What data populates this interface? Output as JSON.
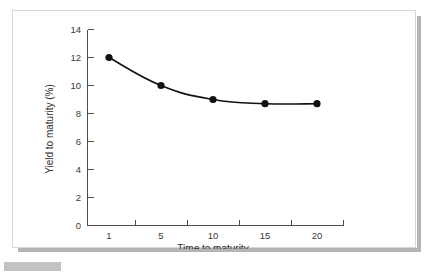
{
  "figure": {
    "background_color": "#ffffff",
    "border_color": "#d8d8d8",
    "shadow_color": "#b4b4b4",
    "tab_color": "#c3c3c3"
  },
  "chart_data": {
    "type": "line",
    "title": "",
    "subtitle": "",
    "xlabel": "Time to maturity",
    "ylabel": "Yield to maturity (%)",
    "categories": [
      "1",
      "5",
      "10",
      "15",
      "20"
    ],
    "values": [
      12.0,
      10.0,
      9.0,
      8.7,
      8.7
    ],
    "series": [
      {
        "name": "Yield to maturity",
        "values": [
          12.0,
          10.0,
          9.0,
          8.7,
          8.7
        ],
        "color": "#111111",
        "marker": "filled-circle"
      }
    ],
    "ylim": [
      0,
      14
    ],
    "yticks": [
      "0",
      "2",
      "4",
      "6",
      "8",
      "10",
      "12",
      "14"
    ],
    "ytick_values": [
      0,
      2,
      4,
      6,
      8,
      10,
      12,
      14
    ],
    "xticks": [
      "1",
      "5",
      "10",
      "15",
      "20"
    ],
    "grid": false,
    "legend": "none",
    "axis_color": "#4c4c4c",
    "tick_label_color": "#3a3a3a"
  }
}
